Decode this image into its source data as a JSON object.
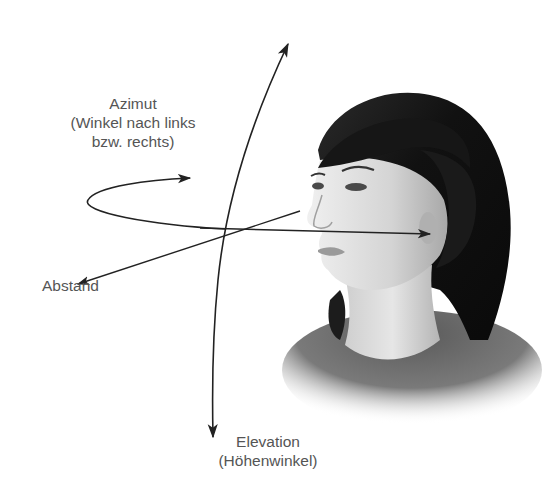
{
  "diagram": {
    "labels": {
      "azimuth": {
        "title": "Azimut",
        "line1": "(Winkel nach links",
        "line2": "bzw. rechts)"
      },
      "distance": "Abstand",
      "elevation": {
        "title": "Elevation",
        "line1": "(Höhenwinkel)"
      }
    },
    "figure": "Profile illustration of a woman's head facing left",
    "colors": {
      "text": "#555555",
      "lines": "#222222",
      "hair": "#1a1a1a",
      "skin": "#d8d8d8",
      "shirt": "#6a6a6a"
    }
  }
}
